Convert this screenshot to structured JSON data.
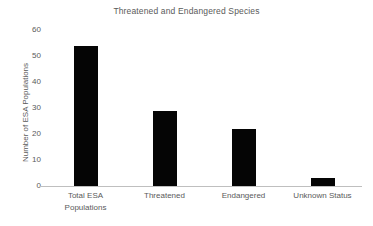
{
  "chart_data": {
    "type": "bar",
    "title": "Threatened and Endangered Species",
    "xlabel": "",
    "ylabel": "Number of ESA Populations",
    "categories": [
      "Total ESA Populations",
      "Threatened",
      "Endangered",
      "Unknown Status"
    ],
    "category_lines": [
      [
        "Total ESA",
        "Populations"
      ],
      [
        "Threatened"
      ],
      [
        "Endangered"
      ],
      [
        "Unknown Status"
      ]
    ],
    "values": [
      54,
      29,
      22,
      3
    ],
    "ylim": [
      0,
      60
    ],
    "yticks": [
      0,
      10,
      20,
      30,
      40,
      50,
      60
    ],
    "ytick_labels": [
      "0",
      "10",
      "20",
      "30",
      "40",
      "50",
      "60"
    ],
    "grid": false,
    "legend": false,
    "bar_color": "#050505",
    "axis_color": "#bfbfbf",
    "text_color": "#5a5a5a",
    "background_color": "#ffffff"
  }
}
